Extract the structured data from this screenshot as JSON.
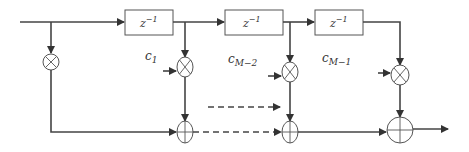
{
  "diagram": {
    "type": "tapped delay line / transversal filter block diagram",
    "delay_blocks": [
      {
        "label": "z",
        "exp": "−1"
      },
      {
        "label": "z",
        "exp": "−1"
      },
      {
        "label": "z",
        "exp": "−1"
      }
    ],
    "coefficients": [
      {
        "base": "c",
        "sub": "1"
      },
      {
        "base": "c",
        "sub": "M−2"
      },
      {
        "base": "c",
        "sub": "M−1"
      }
    ],
    "multiplier_symbol": "multiply-node",
    "adder_symbol": "sum-node",
    "colors": {
      "line": "#444444",
      "background": "#ffffff"
    }
  }
}
